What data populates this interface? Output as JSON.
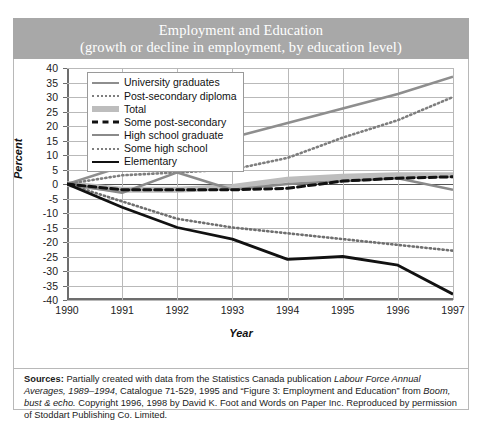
{
  "title": {
    "line1": "Employment and Education",
    "line2": "(growth or decline in employment, by education level)",
    "banner_color": "#a8a8a8",
    "text_color": "#ffffff"
  },
  "axes": {
    "ylabel": "Percent",
    "xlabel": "Year",
    "yticks": [
      "40",
      "35",
      "30",
      "25",
      "20",
      "15",
      "10",
      "5",
      "0",
      "-5",
      "-10",
      "-15",
      "-20",
      "-25",
      "-30",
      "-35",
      "-40"
    ],
    "xticks": [
      "1990",
      "1991",
      "1992",
      "1993",
      "1994",
      "1995",
      "1996",
      "1997"
    ]
  },
  "legend": {
    "items": [
      {
        "label": "University graduates",
        "style": "solid-gray",
        "color": "#8e8e8e"
      },
      {
        "label": "Post-secondary diploma",
        "style": "dot-gray",
        "color": "#7e7e7e"
      },
      {
        "label": "Total",
        "style": "thick-gray",
        "color": "#bdbdbd"
      },
      {
        "label": "Some post-secondary",
        "style": "dash-black",
        "color": "#111111"
      },
      {
        "label": "High school graduate",
        "style": "solid-gray2",
        "color": "#8a8a8a"
      },
      {
        "label": "Some high school",
        "style": "dot-gray2",
        "color": "#7e7e7e"
      },
      {
        "label": "Elementary",
        "style": "solid-black",
        "color": "#111111"
      }
    ]
  },
  "source": {
    "label": "Sources:",
    "text_part1": " Partially created with data from the Statistics Canada publication ",
    "italic1": "Labour Force Annual Averages, 1989–1994",
    "text_part2": ", Catalogue 71-529, 1995  and “Figure 3: Employment and Education” from ",
    "italic2": "Boom, bust & echo.",
    "text_part3": " Copyright 1996, 1998 by David K. Foot and Words on Paper Inc. Reproduced by permission of Stoddart Publishing Co. Limited."
  },
  "chart_data": {
    "type": "line",
    "title": "Employment and Education (growth or decline in employment, by education level)",
    "xlabel": "Year",
    "ylabel": "Percent",
    "x": [
      1990,
      1991,
      1992,
      1993,
      1994,
      1995,
      1996,
      1997
    ],
    "xlim": [
      1990,
      1997
    ],
    "ylim": [
      -40,
      40
    ],
    "ytick_step": 5,
    "grid": true,
    "legend_position": "top-left-inside",
    "series": [
      {
        "name": "University graduates",
        "values": [
          0,
          6,
          11,
          16,
          21,
          26,
          31,
          37
        ]
      },
      {
        "name": "Post-secondary diploma",
        "values": [
          0,
          3,
          4,
          5,
          9,
          16,
          22,
          30
        ]
      },
      {
        "name": "Total",
        "values": [
          0,
          -2,
          -2,
          -1,
          1.5,
          2.5,
          3,
          3
        ]
      },
      {
        "name": "Some post-secondary",
        "values": [
          0,
          -2,
          -2,
          -2,
          -1.5,
          1,
          2,
          2.5
        ]
      },
      {
        "name": "High school graduate",
        "values": [
          0,
          -3,
          4,
          -2,
          0,
          1,
          2,
          -2
        ]
      },
      {
        "name": "Some high school",
        "values": [
          0,
          -6,
          -12,
          -15,
          -17,
          -19,
          -21,
          -23
        ]
      },
      {
        "name": "Elementary",
        "values": [
          0,
          -8,
          -15,
          -19,
          -26,
          -25,
          -28,
          -38
        ]
      }
    ]
  }
}
